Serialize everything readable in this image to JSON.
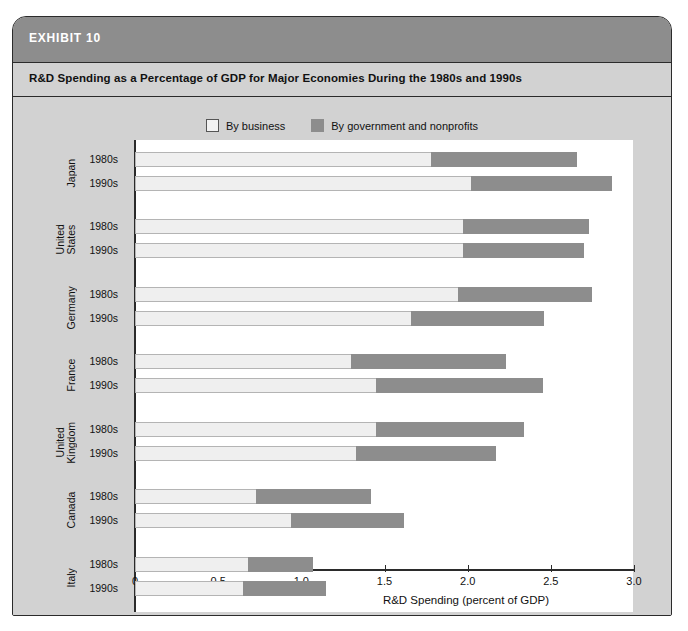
{
  "exhibit": {
    "label": "EXHIBIT 10",
    "subtitle": "R&D Spending as a Percentage of GDP for Major Economies During the 1980s and 1990s"
  },
  "legend": {
    "items": [
      {
        "label": "By business",
        "color": "#efefef",
        "name": "by-business"
      },
      {
        "label": "By government and nonprofits",
        "color": "#8d8d8d",
        "name": "by-government-and-nonprofits"
      }
    ]
  },
  "chart_data": {
    "type": "bar",
    "orientation": "horizontal",
    "stacked": true,
    "title": "R&D Spending as a Percentage of GDP for Major Economies During the 1980s and 1990s",
    "xlabel": "R&D Spending (percent of GDP)",
    "ylabel": "",
    "xlim": [
      0,
      3.0
    ],
    "xticks": [
      0,
      0.5,
      1.0,
      1.5,
      2.0,
      2.5,
      3.0
    ],
    "xticklabels": [
      "0",
      "0.5",
      "1.0",
      "1.5",
      "2.0",
      "2.5",
      "3.0"
    ],
    "grid": false,
    "legend_position": "top-center",
    "series": [
      {
        "name": "By business",
        "color": "#efefef"
      },
      {
        "name": "By government and nonprofits",
        "color": "#8d8d8d"
      }
    ],
    "groups": [
      {
        "country": "Japan",
        "rows": [
          {
            "period": "1980s",
            "business": 1.78,
            "government": 0.88,
            "total": 2.66
          },
          {
            "period": "1990s",
            "business": 2.02,
            "government": 0.85,
            "total": 2.87
          }
        ]
      },
      {
        "country": "United States",
        "rows": [
          {
            "period": "1980s",
            "business": 1.97,
            "government": 0.76,
            "total": 2.73
          },
          {
            "period": "1990s",
            "business": 1.97,
            "government": 0.73,
            "total": 2.7
          }
        ]
      },
      {
        "country": "Germany",
        "rows": [
          {
            "period": "1980s",
            "business": 1.94,
            "government": 0.81,
            "total": 2.75
          },
          {
            "period": "1990s",
            "business": 1.66,
            "government": 0.8,
            "total": 2.46
          }
        ]
      },
      {
        "country": "France",
        "rows": [
          {
            "period": "1980s",
            "business": 1.3,
            "government": 0.93,
            "total": 2.23
          },
          {
            "period": "1990s",
            "business": 1.45,
            "government": 1.0,
            "total": 2.45
          }
        ]
      },
      {
        "country": "United Kingdom",
        "rows": [
          {
            "period": "1980s",
            "business": 1.45,
            "government": 0.89,
            "total": 2.34
          },
          {
            "period": "1990s",
            "business": 1.33,
            "government": 0.84,
            "total": 2.17
          }
        ]
      },
      {
        "country": "Canada",
        "rows": [
          {
            "period": "1980s",
            "business": 0.73,
            "government": 0.69,
            "total": 1.42
          },
          {
            "period": "1990s",
            "business": 0.94,
            "government": 0.68,
            "total": 1.62
          }
        ]
      },
      {
        "country": "Italy",
        "rows": [
          {
            "period": "1980s",
            "business": 0.68,
            "government": 0.39,
            "total": 1.07
          },
          {
            "period": "1990s",
            "business": 0.65,
            "government": 0.5,
            "total": 1.15
          }
        ]
      }
    ]
  }
}
